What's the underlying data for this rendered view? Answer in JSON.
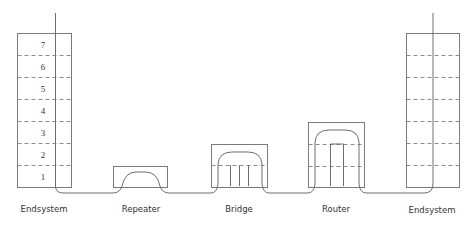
{
  "diagram": {
    "nodes": [
      {
        "id": "endsystem-left",
        "label": "Endsystem",
        "layers": [
          "7",
          "6",
          "5",
          "4",
          "3",
          "2",
          "1"
        ]
      },
      {
        "id": "repeater",
        "label": "Repeater",
        "layers_used": 1
      },
      {
        "id": "bridge",
        "label": "Bridge",
        "layers_used": 2
      },
      {
        "id": "router",
        "label": "Router",
        "layers_used": 3
      },
      {
        "id": "endsystem-right",
        "label": "Endsystem",
        "layers": [
          "",
          "",
          "",
          "",
          "",
          "",
          ""
        ]
      }
    ],
    "labels": {
      "endsystem_left": "Endsystem",
      "repeater": "Repeater",
      "bridge": "Bridge",
      "router": "Router",
      "endsystem_right": "Endsystem"
    },
    "layer_numbers": {
      "l7": "7",
      "l6": "6",
      "l5": "5",
      "l4": "4",
      "l3": "3",
      "l2": "2",
      "l1": "1"
    },
    "colors": {
      "stroke": "#7a7a7a",
      "text": "#333333",
      "background": "#ffffff"
    }
  }
}
